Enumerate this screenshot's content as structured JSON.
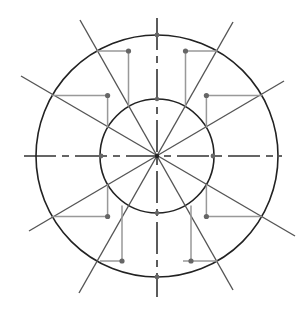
{
  "diagram": {
    "type": "geometric-construction",
    "center": [
      157,
      156
    ],
    "outer_circle": {
      "radius": 121
    },
    "inner_circle": {
      "radius": 57
    },
    "axes": {
      "horizontal": {
        "x1": 24,
        "x2": 282,
        "style": "dash-dot"
      },
      "vertical": {
        "y1": 18,
        "y2": 297,
        "style": "dash-dot"
      }
    },
    "radial_lines": [
      {
        "angle_deg": 30,
        "extent_pos": 160,
        "extent_neg": 160
      },
      {
        "angle_deg": 60,
        "extent_pos": 154,
        "extent_neg": 158
      },
      {
        "angle_deg": 120,
        "extent_pos": 140,
        "extent_neg": 154
      },
      {
        "angle_deg": 150,
        "extent_pos": 159,
        "extent_neg": 148
      }
    ],
    "axis_dots": [
      [
        157,
        35
      ],
      [
        157,
        277
      ],
      [
        101,
        156
      ],
      [
        213,
        156
      ],
      [
        157,
        99
      ],
      [
        157,
        213
      ]
    ],
    "colors": {
      "circle": "#222222",
      "ray": "#555555",
      "axis": "#333333",
      "leader": "#999999",
      "dot": "#666666",
      "background": "#ffffff"
    }
  }
}
